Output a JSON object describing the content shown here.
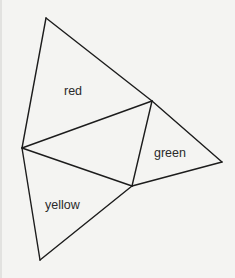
{
  "diagram": {
    "vertices": {
      "A": [
        46,
        18
      ],
      "B": [
        152,
        101
      ],
      "C": [
        22,
        148
      ],
      "D": [
        132,
        186
      ],
      "E": [
        222,
        162
      ],
      "F": [
        40,
        260
      ]
    },
    "edges": [
      [
        "A",
        "B"
      ],
      [
        "B",
        "E"
      ],
      [
        "A",
        "C"
      ],
      [
        "C",
        "B"
      ],
      [
        "B",
        "D"
      ],
      [
        "C",
        "D"
      ],
      [
        "D",
        "E"
      ],
      [
        "C",
        "F"
      ],
      [
        "F",
        "D"
      ]
    ],
    "regions": [
      {
        "label": "red",
        "x": 64,
        "y": 95
      },
      {
        "label": "green",
        "x": 154,
        "y": 157
      },
      {
        "label": "yellow",
        "x": 45,
        "y": 209
      }
    ],
    "line_color": "#1c1c1c",
    "background": "#f4f4f2"
  }
}
